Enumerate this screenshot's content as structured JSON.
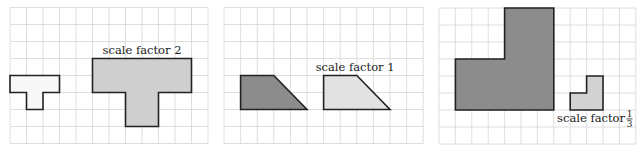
{
  "panels": [
    {
      "id": "panel-1",
      "grid": {
        "cols": 12,
        "rows": 8
      },
      "shapes": [
        {
          "name": "original-t-shape",
          "fill": "#f7f7f7",
          "points": [
            [
              0,
              4
            ],
            [
              3,
              4
            ],
            [
              3,
              5
            ],
            [
              2,
              5
            ],
            [
              2,
              6
            ],
            [
              1,
              6
            ],
            [
              1,
              5
            ],
            [
              0,
              5
            ]
          ]
        },
        {
          "name": "enlarged-t-shape",
          "fill": "#cfcfcf",
          "points": [
            [
              5,
              3
            ],
            [
              11,
              3
            ],
            [
              11,
              5
            ],
            [
              9,
              5
            ],
            [
              9,
              7
            ],
            [
              7,
              7
            ],
            [
              7,
              5
            ],
            [
              5,
              5
            ]
          ]
        }
      ],
      "label": {
        "text": "scale factor 2",
        "fraction": null,
        "anchor_cell": [
          8,
          2.75
        ],
        "align": "middle"
      }
    },
    {
      "id": "panel-2",
      "grid": {
        "cols": 12,
        "rows": 8
      },
      "shapes": [
        {
          "name": "original-trapezoid",
          "fill": "#8c8c8c",
          "points": [
            [
              1,
              4
            ],
            [
              3,
              4
            ],
            [
              5,
              6
            ],
            [
              1,
              6
            ]
          ]
        },
        {
          "name": "copy-trapezoid",
          "fill": "#e2e2e2",
          "points": [
            [
              6,
              4
            ],
            [
              8,
              4
            ],
            [
              10,
              6
            ],
            [
              6,
              6
            ]
          ]
        }
      ],
      "label": {
        "text": "scale factor 1",
        "fraction": null,
        "anchor_cell": [
          7.9,
          3.75
        ],
        "align": "middle"
      }
    },
    {
      "id": "panel-3",
      "grid": {
        "cols": 12,
        "rows": 8
      },
      "shapes": [
        {
          "name": "original-l-shape",
          "fill": "#8c8c8c",
          "points": [
            [
              4,
              0
            ],
            [
              7,
              0
            ],
            [
              7,
              6
            ],
            [
              1,
              6
            ],
            [
              1,
              3
            ],
            [
              4,
              3
            ]
          ]
        },
        {
          "name": "reduced-l-shape",
          "fill": "#d2d2d2",
          "points": [
            [
              9,
              4
            ],
            [
              10,
              4
            ],
            [
              10,
              6
            ],
            [
              8,
              6
            ],
            [
              8,
              5
            ],
            [
              9,
              5
            ]
          ]
        }
      ],
      "label": {
        "text": "scale factor ",
        "fraction": {
          "numerator": "1",
          "denominator": "3"
        },
        "anchor_cell": [
          7.2,
          6.7
        ],
        "align": "start"
      }
    }
  ]
}
